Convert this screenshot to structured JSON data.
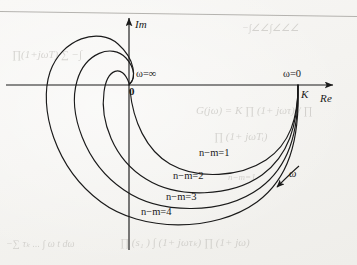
{
  "figure": {
    "kind": "nyquist-polar-plot",
    "background_color": "#f4f3f0",
    "ink_color": "#1a1a1a"
  },
  "axes": {
    "imaginary_label": "Im",
    "real_label": "Re",
    "origin_label": "0",
    "gain_label": "K"
  },
  "annotations": {
    "omega_infinity": "ω=∞",
    "omega_zero": "ω=0",
    "omega_direction": "ω"
  },
  "curves": [
    {
      "label": "n−m=1",
      "order_difference": 1
    },
    {
      "label": "n−m=2",
      "order_difference": 2
    },
    {
      "label": "n−m=3",
      "order_difference": 3
    },
    {
      "label": "n−m=4",
      "order_difference": 4
    }
  ],
  "chart_data": {
    "type": "line",
    "title": "",
    "xlabel": "Re",
    "ylabel": "Im",
    "grid": false,
    "legend_position": "inline-on-curves",
    "start_point": {
      "x": "K",
      "y": 0,
      "omega": "0"
    },
    "end_point": {
      "x": 0,
      "y": 0,
      "omega": "∞"
    },
    "series": [
      {
        "name": "n−m=1",
        "total_phase_sweep_deg": -90,
        "quadrants_traversed": [
          "IV"
        ]
      },
      {
        "name": "n−m=2",
        "total_phase_sweep_deg": -180,
        "quadrants_traversed": [
          "IV",
          "III"
        ]
      },
      {
        "name": "n−m=3",
        "total_phase_sweep_deg": -270,
        "quadrants_traversed": [
          "IV",
          "III",
          "II"
        ]
      },
      {
        "name": "n−m=4",
        "total_phase_sweep_deg": -360,
        "quadrants_traversed": [
          "IV",
          "III",
          "II",
          "I"
        ]
      }
    ]
  },
  "bleed_through": [
    {
      "text": "−∫∠∠∫∠∠∠",
      "x": 242,
      "y": 22,
      "size": 10
    },
    {
      "text": "∏(1+jωT) ∑ −∫",
      "x": 12,
      "y": 48,
      "size": 11
    },
    {
      "text": "G(jω) = K ∏ (1+ jωτ) / ∏",
      "x": 196,
      "y": 104,
      "size": 11
    },
    {
      "text": "∏ (1+ jωTᵢ)",
      "x": 214,
      "y": 130,
      "size": 11
    },
    {
      "text": "n−m=1",
      "x": 228,
      "y": 172,
      "size": 9
    },
    {
      "text": "∏ (s₁ ) ∫ (1+ jωτₖ) ∏ (1+ jω)",
      "x": 120,
      "y": 236,
      "size": 11
    },
    {
      "text": "−∑ τₖ ... ∫ ω t dω",
      "x": 6,
      "y": 238,
      "size": 10
    }
  ]
}
